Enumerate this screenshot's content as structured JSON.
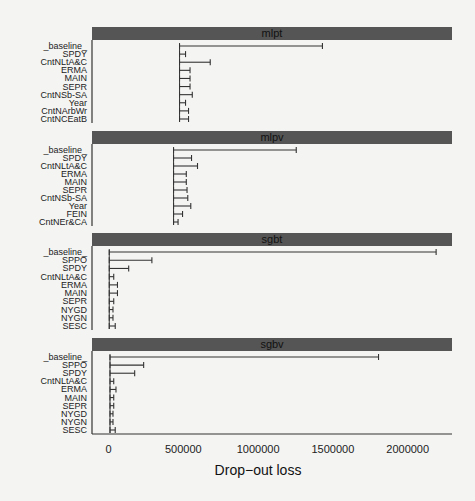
{
  "chart_data": {
    "type": "bar",
    "subtype": "faceted-interval (drop-out loss from baseline)",
    "xlabel": "Drop-out loss",
    "xlim": [
      0,
      2300000
    ],
    "x_ticks": [
      0,
      500000,
      1000000,
      1500000,
      2000000
    ],
    "x_tick_labels": [
      "0",
      "500000",
      "1000000",
      "1500000",
      "2000000"
    ],
    "grid": false,
    "legend": null,
    "panels": [
      {
        "title": "mlpt",
        "start": 475000,
        "categories": [
          "_baseline_",
          "SPDY",
          "CntNLtA&C",
          "ERMA",
          "MAIN",
          "SEPR",
          "CntNSb-SA",
          "Year",
          "CntNArbWr",
          "CntNCEatB"
        ],
        "values": [
          1430000,
          515000,
          680000,
          545000,
          545000,
          545000,
          560000,
          515000,
          535000,
          535000
        ]
      },
      {
        "title": "mlpv",
        "start": 435000,
        "categories": [
          "_baseline_",
          "SPDY",
          "CntNLtA&C",
          "ERMA",
          "MAIN",
          "SEPR",
          "CntNSb-SA",
          "Year",
          "FEIN",
          "CntNEr&CA"
        ],
        "values": [
          1255000,
          555000,
          595000,
          520000,
          520000,
          525000,
          530000,
          550000,
          495000,
          465000
        ]
      },
      {
        "title": "sgbt",
        "start": 5000,
        "categories": [
          "_baseline_",
          "SPPO",
          "SPDY",
          "CntNLtA&C",
          "ERMA",
          "MAIN",
          "SEPR",
          "NYGD",
          "NYGN",
          "SESC"
        ],
        "values": [
          2190000,
          290000,
          135000,
          35000,
          60000,
          60000,
          35000,
          30000,
          30000,
          45000
        ]
      },
      {
        "title": "sgbv",
        "start": 10000,
        "categories": [
          "_baseline_",
          "SPPO",
          "SPDY",
          "CntNLtA&C",
          "ERMA",
          "MAIN",
          "SEPR",
          "NYGD",
          "NYGN",
          "SESC"
        ],
        "values": [
          1805000,
          235000,
          175000,
          35000,
          50000,
          35000,
          35000,
          30000,
          30000,
          45000
        ]
      }
    ]
  },
  "colors": {
    "background": "#f4f4f3",
    "strip": "#555555",
    "bar": "#333333",
    "axis": "#333333"
  }
}
